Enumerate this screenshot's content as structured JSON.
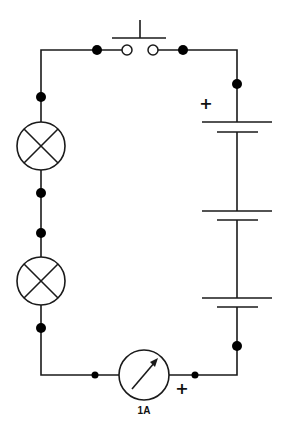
{
  "diagram": {
    "type": "series circuit schematic",
    "components": {
      "push_switch": {
        "name": "Push-button switch (normally open)"
      },
      "battery": {
        "name": "Battery of 3 cells",
        "cells": 3,
        "polarity_label": "+"
      },
      "lamps": [
        {
          "name": "Lamp 1"
        },
        {
          "name": "Lamp 2"
        }
      ],
      "ammeter": {
        "name": "Ammeter",
        "reading": "1A",
        "polarity_label": "+"
      }
    },
    "colors": {
      "wire": "#1a1a1a",
      "node": "#000000",
      "background": "#ffffff"
    }
  }
}
